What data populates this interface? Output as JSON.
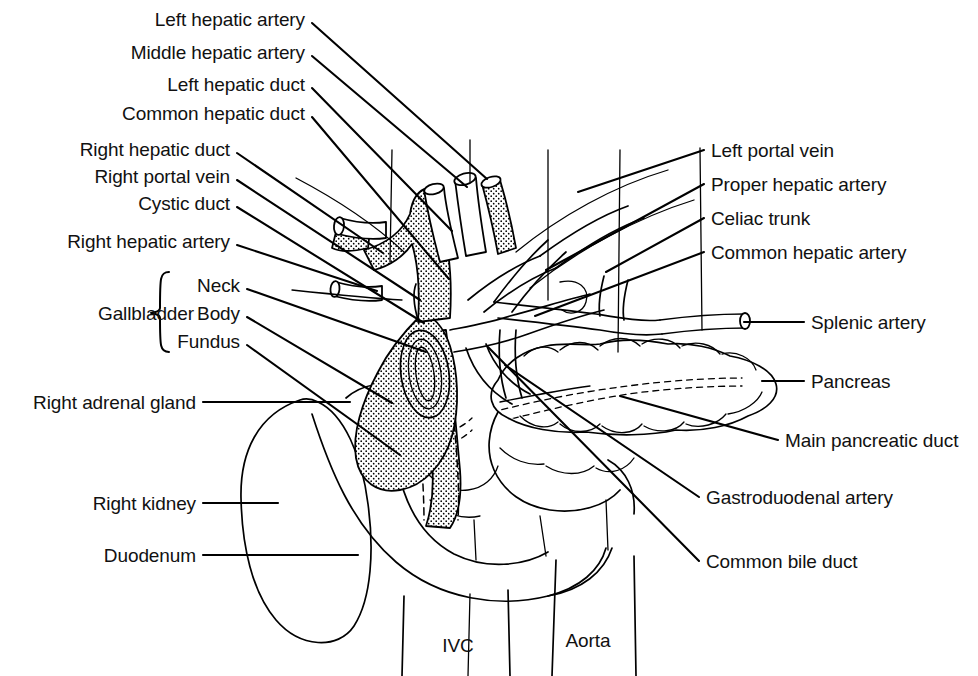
{
  "figure": {
    "background_color": "#ffffff",
    "ink_color": "#000000",
    "caption_partial": ""
  },
  "labels_left": [
    {
      "id": "left-hepatic-artery",
      "text": "Left hepatic artery",
      "text_x": 305,
      "text_y": 19,
      "leader": [
        312,
        23,
        487,
        179
      ]
    },
    {
      "id": "middle-hepatic-artery",
      "text": "Middle hepatic artery",
      "text_x": 305,
      "text_y": 52,
      "leader": [
        312,
        56,
        467,
        187
      ]
    },
    {
      "id": "left-hepatic-duct",
      "text": "Left hepatic duct",
      "text_x": 305,
      "text_y": 84,
      "leader": [
        312,
        88,
        452,
        231
      ]
    },
    {
      "id": "common-hepatic-duct",
      "text": "Common hepatic duct",
      "text_x": 305,
      "text_y": 113,
      "leader": [
        312,
        117,
        449,
        279
      ]
    },
    {
      "id": "right-hepatic-duct",
      "text": "Right hepatic duct",
      "text_x": 230,
      "text_y": 149,
      "leader": [
        237,
        153,
        383,
        253
      ]
    },
    {
      "id": "right-portal-vein",
      "text": "Right portal vein",
      "text_x": 230,
      "text_y": 176,
      "leader": [
        237,
        180,
        420,
        300
      ]
    },
    {
      "id": "cystic-duct",
      "text": "Cystic duct",
      "text_x": 230,
      "text_y": 203,
      "leader": [
        237,
        207,
        424,
        323
      ]
    },
    {
      "id": "right-hepatic-artery",
      "text": "Right hepatic artery",
      "text_x": 230,
      "text_y": 241,
      "leader": [
        237,
        245,
        377,
        291
      ]
    },
    {
      "id": "gallbladder-neck",
      "text": "Neck",
      "text_x": 240,
      "text_y": 285,
      "leader": [
        247,
        289,
        426,
        352
      ]
    },
    {
      "id": "gallbladder-body",
      "text": "Body",
      "text_x": 240,
      "text_y": 313,
      "leader": [
        247,
        317,
        392,
        403
      ]
    },
    {
      "id": "gallbladder-fundus",
      "text": "Fundus",
      "text_x": 240,
      "text_y": 341,
      "leader": [
        247,
        345,
        400,
        455
      ]
    },
    {
      "id": "right-adrenal-gland",
      "text": "Right adrenal gland",
      "text_x": 196,
      "text_y": 402,
      "leader": [
        203,
        402,
        350,
        402
      ]
    },
    {
      "id": "right-kidney",
      "text": "Right kidney",
      "text_x": 196,
      "text_y": 503,
      "leader": [
        203,
        503,
        278,
        503
      ]
    },
    {
      "id": "duodenum",
      "text": "Duodenum",
      "text_x": 196,
      "text_y": 555,
      "leader": [
        203,
        555,
        358,
        555
      ]
    }
  ],
  "labels_right": [
    {
      "id": "left-portal-vein",
      "text": "Left portal vein",
      "text_x": 711,
      "text_y": 150,
      "leader": [
        704,
        150,
        578,
        192
      ]
    },
    {
      "id": "proper-hepatic-artery",
      "text": "Proper hepatic artery",
      "text_x": 711,
      "text_y": 184,
      "leader": [
        704,
        184,
        546,
        270
      ]
    },
    {
      "id": "celiac-trunk",
      "text": "Celiac trunk",
      "text_x": 711,
      "text_y": 218,
      "leader": [
        704,
        218,
        606,
        272
      ]
    },
    {
      "id": "common-hepatic-artery",
      "text": "Common hepatic artery",
      "text_x": 711,
      "text_y": 252,
      "leader": [
        704,
        252,
        535,
        316
      ]
    },
    {
      "id": "splenic-artery",
      "text": "Splenic artery",
      "text_x": 811,
      "text_y": 322,
      "leader": [
        804,
        322,
        744,
        322
      ]
    },
    {
      "id": "pancreas",
      "text": "Pancreas",
      "text_x": 811,
      "text_y": 381,
      "leader": [
        804,
        381,
        762,
        381
      ]
    },
    {
      "id": "main-pancreatic-duct",
      "text": "Main pancreatic duct",
      "text_x": 785,
      "text_y": 440,
      "leader": [
        778,
        440,
        620,
        396
      ]
    },
    {
      "id": "gastroduodenal-artery",
      "text": "Gastroduodenal artery",
      "text_x": 706,
      "text_y": 497,
      "leader": [
        699,
        497,
        505,
        365
      ]
    },
    {
      "id": "common-bile-duct",
      "text": "Common bile duct",
      "text_x": 706,
      "text_y": 561,
      "leader": [
        699,
        561,
        488,
        347
      ]
    }
  ],
  "labels_inline": [
    {
      "id": "gallbladder-group",
      "text": "Gallbladder",
      "text_x": 146,
      "text_y": 313
    },
    {
      "id": "ivc",
      "text": "IVC",
      "text_x": 458,
      "text_y": 645
    },
    {
      "id": "aorta",
      "text": "Aorta",
      "text_x": 588,
      "text_y": 640
    }
  ],
  "brace": {
    "id": "gallbladder-brace",
    "x": 160,
    "top_y": 272,
    "bottom_y": 352,
    "mid_y": 313
  },
  "structures": [
    {
      "id": "liver-hilum-outline",
      "name": "Liver hilum / porta hepatis outline"
    },
    {
      "id": "biliary-tree",
      "name": "Stippled biliary ductal tree"
    },
    {
      "id": "gallbladder-sac",
      "name": "Gallbladder (stippled)"
    },
    {
      "id": "common-bile-duct-shape",
      "name": "Common bile duct descending behind duodenum"
    },
    {
      "id": "pancreas-body",
      "name": "Pancreas (lobulated outline)"
    },
    {
      "id": "pancreatic-duct-dashed",
      "name": "Main pancreatic duct (hidden, dashed)"
    },
    {
      "id": "duodenum-loop",
      "name": "Duodenal C-loop"
    },
    {
      "id": "right-kidney-outline",
      "name": "Right kidney outline"
    },
    {
      "id": "adrenal-gland-outline",
      "name": "Right adrenal gland outline"
    },
    {
      "id": "celiac-axis-vessels",
      "name": "Celiac trunk, common/proper hepatic and splenic arteries"
    },
    {
      "id": "portal-vein-branches",
      "name": "Portal vein and its right/left branches"
    },
    {
      "id": "ivc-vessel",
      "name": "Inferior vena cava"
    },
    {
      "id": "aorta-vessel",
      "name": "Abdominal aorta"
    }
  ]
}
